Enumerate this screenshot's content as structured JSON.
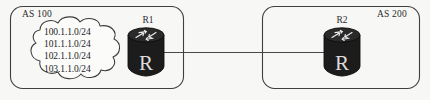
{
  "diagram": {
    "background_color": "#f7f7f5",
    "line_color": "#4a4a4a",
    "router_body_color": "#1c1c1c",
    "text_color": "#2b2b2b"
  },
  "left_domain": {
    "as_label": "AS 100",
    "cloud": {
      "name": "network-cloud",
      "prefixes": [
        "100.1.1.0/24",
        "101.1.1.0/24",
        "102.1.1.0/24",
        "103.1.1.0/24"
      ]
    },
    "router": {
      "label": "R1",
      "glyph": "R",
      "icon": "router-icon"
    }
  },
  "right_domain": {
    "as_label": "AS 200",
    "router": {
      "label": "R2",
      "glyph": "R",
      "icon": "router-icon"
    }
  },
  "link": {
    "name": "inter-as-link",
    "from": "R1",
    "to": "R2"
  }
}
